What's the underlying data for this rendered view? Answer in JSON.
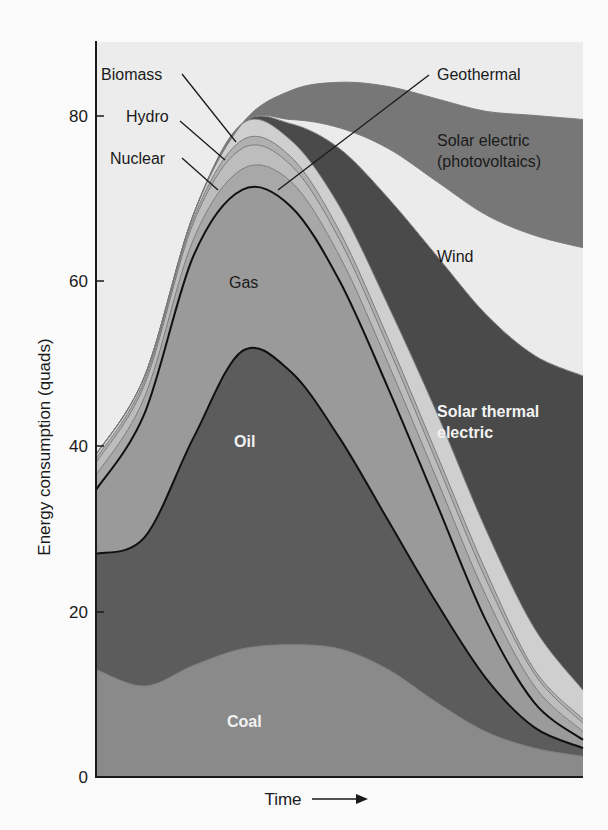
{
  "chart_data": {
    "type": "area",
    "stacked": true,
    "title": "",
    "xlabel": "Time",
    "ylabel": "Energy consumption (quads)",
    "ylim": [
      0,
      88
    ],
    "yticks": [
      0,
      20,
      40,
      60,
      80
    ],
    "x": [
      0,
      1,
      2,
      3,
      4,
      5,
      6,
      7,
      8,
      9,
      10
    ],
    "x_note": "Unlabeled time axis (arrow pointing right)",
    "grid": false,
    "series": [
      {
        "name": "Coal",
        "color": "#8a8a8a",
        "values": [
          13,
          11,
          13.5,
          15.5,
          16,
          15.5,
          13,
          9,
          5.5,
          3.5,
          2.5
        ]
      },
      {
        "name": "Oil",
        "color": "#5c5c5c",
        "values": [
          14,
          18,
          27.5,
          36,
          33,
          25.5,
          18,
          12,
          6.5,
          2.5,
          1.0
        ]
      },
      {
        "name": "Gas",
        "color": "#9a9a9a",
        "values": [
          7.7,
          15,
          22,
          19.5,
          20,
          19,
          16,
          12,
          7,
          3,
          1.0
        ]
      },
      {
        "name": "Nuclear",
        "color": "#a8a8a8",
        "values": [
          1.8,
          2,
          2,
          2.5,
          3,
          3,
          3,
          3,
          3,
          2,
          1.0
        ]
      },
      {
        "name": "Hydro",
        "color": "#bdbdbd",
        "values": [
          1.5,
          1.5,
          2,
          2.5,
          2,
          2,
          2,
          2,
          2,
          1.5,
          1.0
        ]
      },
      {
        "name": "Geothermal",
        "color": "#b0b0b0",
        "values": [
          0.5,
          0.5,
          0.5,
          1,
          1,
          1,
          1,
          1,
          1,
          0.5,
          0.5
        ]
      },
      {
        "name": "Biomass",
        "color": "#cfcfcf",
        "values": [
          0.5,
          0.5,
          0.5,
          2,
          2,
          3,
          4,
          5,
          5,
          5,
          3.5
        ]
      },
      {
        "name": "Solar thermal electric",
        "color": "#4a4a4a",
        "values": [
          0,
          0,
          0,
          0,
          2,
          7,
          13,
          19,
          26,
          33,
          38
        ]
      },
      {
        "name": "Wind",
        "color": "#ebebeb",
        "values": [
          0,
          0,
          0,
          0,
          0.5,
          2.5,
          6,
          9,
          12,
          14.5,
          15.5
        ]
      },
      {
        "name": "Solar electric (photovoltaics)",
        "color": "#777777",
        "values": [
          0,
          0,
          0,
          0,
          3.5,
          5.5,
          7.5,
          10,
          12.5,
          14.5,
          15.5
        ]
      }
    ],
    "annotations": [
      {
        "text": "Biomass",
        "type": "leader"
      },
      {
        "text": "Hydro",
        "type": "leader"
      },
      {
        "text": "Nuclear",
        "type": "leader"
      },
      {
        "text": "Geothermal",
        "type": "leader"
      },
      {
        "text": "Gas",
        "type": "inline"
      },
      {
        "text": "Oil",
        "type": "inline"
      },
      {
        "text": "Coal",
        "type": "inline"
      },
      {
        "text": "Wind",
        "type": "inline"
      },
      {
        "text": "Solar thermal electric",
        "type": "inline"
      },
      {
        "text": "Solar electric (photovoltaics)",
        "type": "inline"
      }
    ]
  },
  "axis": {
    "ylabel": "Energy consumption (quads)",
    "xlabel": "Time",
    "ticks": [
      "0",
      "20",
      "40",
      "60",
      "80"
    ]
  },
  "labels": {
    "biomass": "Biomass",
    "hydro": "Hydro",
    "nuclear": "Nuclear",
    "geothermal": "Geothermal",
    "gas": "Gas",
    "oil": "Oil",
    "coal": "Coal",
    "wind": "Wind",
    "solar_thermal_1": "Solar thermal",
    "solar_thermal_2": "electric",
    "solar_pv_1": "Solar electric",
    "solar_pv_2": "(photovoltaics)"
  },
  "colors": {
    "plot_background": "#ececec",
    "page_background": "#fbfbfb",
    "axis": "#1a1a1a"
  }
}
